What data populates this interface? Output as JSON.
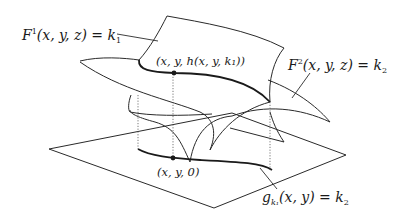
{
  "diagram": {
    "labels": {
      "surface1": {
        "name": "F",
        "sup": "1",
        "args": "(x, y, z) = k",
        "sub": "1"
      },
      "surface2": {
        "name": "F",
        "sup": "2",
        "args": "(x, y, z) = k",
        "sub": "2"
      },
      "point3d": "(x, y, h(x, y, k₁))",
      "point2d": "(x, y, 0)",
      "curve": {
        "name": "g",
        "sub": "k₁",
        "args": "(x, y) = k",
        "sub2": "2"
      }
    },
    "colors": {
      "ink": "#1a1a1a",
      "background": "#ffffff"
    }
  }
}
